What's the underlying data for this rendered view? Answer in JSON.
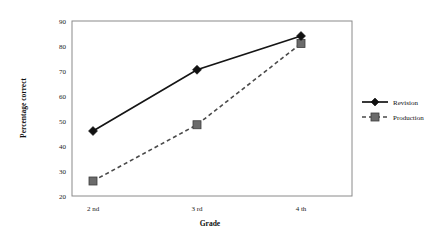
{
  "chart_data": {
    "type": "line",
    "title": "",
    "xlabel": "Grade",
    "ylabel": "Percentage correct",
    "categories": [
      "2 nd",
      "3 rd",
      "4 th"
    ],
    "ylim": [
      20,
      90
    ],
    "yticks": [
      20,
      30,
      40,
      50,
      60,
      70,
      80,
      90
    ],
    "ytick_labels": [
      "20",
      "30",
      "40",
      "50",
      "60",
      "70",
      "80",
      "90"
    ],
    "grid": false,
    "legend_position": "right",
    "series": [
      {
        "name": "Revision",
        "values": [
          46,
          70.5,
          84
        ],
        "line_style": "solid",
        "marker": "diamond",
        "color": "#151515"
      },
      {
        "name": "Production",
        "values": [
          26,
          48.5,
          81
        ],
        "line_style": "dashed",
        "marker": "square",
        "color": "#6b6b6b"
      }
    ]
  },
  "axes": {
    "y_title": "Percentage correct",
    "x_title": "Grade",
    "y_tick_0": "20",
    "y_tick_1": "30",
    "y_tick_2": "40",
    "y_tick_3": "50",
    "y_tick_4": "60",
    "y_tick_5": "70",
    "y_tick_6": "80",
    "y_tick_7": "90",
    "x_cat_0": "2 nd",
    "x_cat_1": "3 rd",
    "x_cat_2": "4 th"
  },
  "legend": {
    "item_0": "Revision",
    "item_1": "Production"
  }
}
